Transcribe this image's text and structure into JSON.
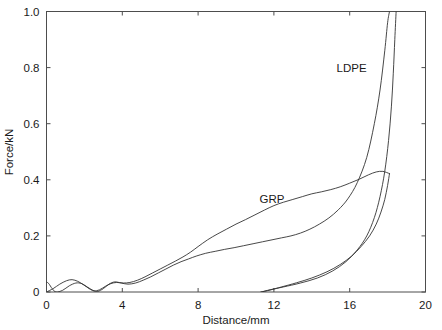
{
  "chart_data": {
    "type": "line",
    "title": "",
    "xlabel": "Distance/mm",
    "ylabel": "Force/kN",
    "xlim": [
      0,
      20
    ],
    "ylim": [
      0,
      1.0
    ],
    "xticks": [
      "0",
      "4",
      "8",
      "12",
      "16",
      "20"
    ],
    "xtick_values": [
      0,
      4,
      8,
      12,
      16,
      20
    ],
    "yticks": [
      "0",
      "0.2",
      "0.4",
      "0.6",
      "0.8",
      "1.0"
    ],
    "ytick_values": [
      0,
      0.2,
      0.4,
      0.6,
      0.8,
      1.0
    ],
    "grid": false,
    "legend_position": "inline-annotation",
    "annotations": [
      {
        "text": "LDPE",
        "x": 16.1,
        "y": 0.785
      },
      {
        "text": "GRP",
        "x": 11.9,
        "y": 0.318
      }
    ],
    "series": [
      {
        "name": "LDPE",
        "label": "LDPE",
        "color": "#333333",
        "description": "Loading curve rising steeply past 16 mm and exiting the top of the axes at 1.0 kN, then unloading back to zero force near 11.3 mm",
        "points": [
          [
            0.0,
            0.036
          ],
          [
            0.12,
            0.03
          ],
          [
            0.3,
            0.012
          ],
          [
            0.5,
            0.0
          ],
          [
            0.85,
            0.006
          ],
          [
            1.2,
            0.022
          ],
          [
            1.55,
            0.032
          ],
          [
            1.85,
            0.03
          ],
          [
            2.15,
            0.018
          ],
          [
            2.45,
            0.006
          ],
          [
            2.7,
            0.002
          ],
          [
            3.0,
            0.012
          ],
          [
            3.3,
            0.028
          ],
          [
            3.6,
            0.036
          ],
          [
            3.95,
            0.032
          ],
          [
            4.3,
            0.028
          ],
          [
            4.7,
            0.032
          ],
          [
            5.1,
            0.042
          ],
          [
            5.5,
            0.054
          ],
          [
            5.9,
            0.068
          ],
          [
            6.3,
            0.082
          ],
          [
            6.7,
            0.096
          ],
          [
            7.1,
            0.108
          ],
          [
            7.5,
            0.118
          ],
          [
            7.9,
            0.128
          ],
          [
            8.4,
            0.138
          ],
          [
            8.9,
            0.145
          ],
          [
            9.4,
            0.152
          ],
          [
            9.9,
            0.158
          ],
          [
            10.4,
            0.165
          ],
          [
            10.9,
            0.172
          ],
          [
            11.4,
            0.179
          ],
          [
            11.9,
            0.186
          ],
          [
            12.4,
            0.193
          ],
          [
            12.9,
            0.2
          ],
          [
            13.4,
            0.21
          ],
          [
            13.9,
            0.224
          ],
          [
            14.4,
            0.242
          ],
          [
            14.9,
            0.264
          ],
          [
            15.4,
            0.293
          ],
          [
            15.9,
            0.332
          ],
          [
            16.4,
            0.39
          ],
          [
            16.9,
            0.48
          ],
          [
            17.3,
            0.6
          ],
          [
            17.6,
            0.72
          ],
          [
            17.85,
            0.86
          ],
          [
            18.0,
            0.96
          ],
          [
            18.1,
            1.0
          ]
        ],
        "unload_points": [
          [
            18.45,
            1.0
          ],
          [
            18.38,
            0.9
          ],
          [
            18.3,
            0.78
          ],
          [
            18.2,
            0.66
          ],
          [
            18.05,
            0.54
          ],
          [
            17.85,
            0.43
          ],
          [
            17.6,
            0.34
          ],
          [
            17.3,
            0.265
          ],
          [
            16.9,
            0.2
          ],
          [
            16.4,
            0.15
          ],
          [
            15.8,
            0.108
          ],
          [
            15.1,
            0.075
          ],
          [
            14.3,
            0.05
          ],
          [
            13.4,
            0.032
          ],
          [
            12.5,
            0.018
          ],
          [
            11.8,
            0.008
          ],
          [
            11.35,
            0.0
          ]
        ]
      },
      {
        "name": "GRP",
        "label": "GRP",
        "color": "#333333",
        "description": "Loading curve rising to a peak of about 0.43 kN near 17.5 mm then unloading back to zero force near 11.3 mm",
        "points": [
          [
            0.0,
            0.0
          ],
          [
            0.35,
            0.012
          ],
          [
            0.7,
            0.028
          ],
          [
            1.05,
            0.04
          ],
          [
            1.35,
            0.044
          ],
          [
            1.65,
            0.038
          ],
          [
            1.95,
            0.026
          ],
          [
            2.25,
            0.012
          ],
          [
            2.5,
            0.004
          ],
          [
            2.8,
            0.008
          ],
          [
            3.1,
            0.02
          ],
          [
            3.4,
            0.03
          ],
          [
            3.7,
            0.034
          ],
          [
            4.05,
            0.032
          ],
          [
            4.4,
            0.034
          ],
          [
            4.8,
            0.042
          ],
          [
            5.2,
            0.054
          ],
          [
            5.6,
            0.068
          ],
          [
            6.0,
            0.082
          ],
          [
            6.4,
            0.096
          ],
          [
            6.8,
            0.11
          ],
          [
            7.2,
            0.125
          ],
          [
            7.6,
            0.142
          ],
          [
            8.0,
            0.162
          ],
          [
            8.5,
            0.186
          ],
          [
            9.0,
            0.206
          ],
          [
            9.5,
            0.224
          ],
          [
            10.0,
            0.242
          ],
          [
            10.5,
            0.258
          ],
          [
            11.0,
            0.275
          ],
          [
            11.5,
            0.292
          ],
          [
            12.0,
            0.308
          ],
          [
            12.5,
            0.32
          ],
          [
            13.0,
            0.33
          ],
          [
            13.5,
            0.34
          ],
          [
            14.0,
            0.35
          ],
          [
            14.5,
            0.357
          ],
          [
            15.0,
            0.365
          ],
          [
            15.5,
            0.375
          ],
          [
            16.0,
            0.388
          ],
          [
            16.5,
            0.402
          ],
          [
            17.0,
            0.418
          ],
          [
            17.4,
            0.428
          ],
          [
            17.75,
            0.43
          ],
          [
            18.1,
            0.422
          ]
        ],
        "unload_points": [
          [
            18.1,
            0.422
          ],
          [
            18.0,
            0.38
          ],
          [
            17.85,
            0.33
          ],
          [
            17.65,
            0.285
          ],
          [
            17.4,
            0.242
          ],
          [
            17.05,
            0.2
          ],
          [
            16.6,
            0.162
          ],
          [
            16.1,
            0.128
          ],
          [
            15.5,
            0.098
          ],
          [
            14.8,
            0.072
          ],
          [
            14.0,
            0.05
          ],
          [
            13.2,
            0.033
          ],
          [
            12.4,
            0.018
          ],
          [
            11.8,
            0.007
          ],
          [
            11.3,
            0.0
          ]
        ]
      }
    ]
  },
  "axes": {
    "x_axis_name": "Distance/mm",
    "y_axis_name": "Force/kN"
  }
}
